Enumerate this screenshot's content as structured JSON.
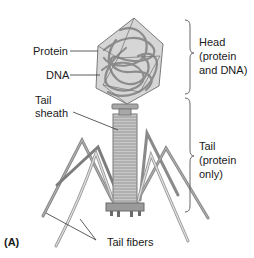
{
  "figure": {
    "panel_label": "(A)"
  },
  "labels": {
    "protein": "Protein",
    "dna": "DNA",
    "tail_sheath_line1": "Tail",
    "tail_sheath_line2": "sheath",
    "tail_fibers": "Tail fibers"
  },
  "brackets": {
    "head": {
      "line1": "Head",
      "line2": "(protein",
      "line3": "and DNA)"
    },
    "tail": {
      "line1": "Tail",
      "line2": "(protein",
      "line3": "only)"
    }
  },
  "colors": {
    "structure_fill": "#c8c8c8",
    "structure_stroke": "#7a7a7a",
    "dna": "#8c8c8c",
    "fiber_dark": "#8a8a8a",
    "fiber_light": "#cfcfcf",
    "leader_line": "#333333"
  }
}
